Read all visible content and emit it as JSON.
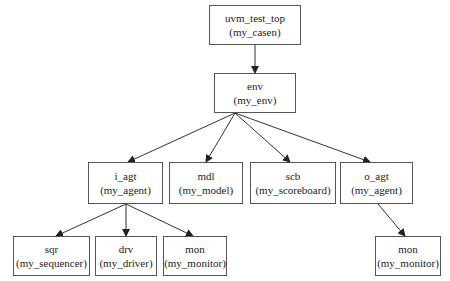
{
  "nodes": {
    "top": {
      "name": "uvm_test_top",
      "type": "(my_casen)"
    },
    "env": {
      "name": "env",
      "type": "(my_env)"
    },
    "i_agt": {
      "name": "i_agt",
      "type": "(my_agent)"
    },
    "mdl": {
      "name": "mdl",
      "type": "(my_model)"
    },
    "scb": {
      "name": "scb",
      "type": "(my_scoreboard)"
    },
    "o_agt": {
      "name": "o_agt",
      "type": "(my_agent)"
    },
    "sqr": {
      "name": "sqr",
      "type": "(my_sequencer)"
    },
    "drv": {
      "name": "drv",
      "type": "(my_driver)"
    },
    "mon_i": {
      "name": "mon",
      "type": "(my_monitor)"
    },
    "mon_o": {
      "name": "mon",
      "type": "(my_monitor)"
    }
  },
  "edges": [
    [
      "top",
      "env"
    ],
    [
      "env",
      "i_agt"
    ],
    [
      "env",
      "mdl"
    ],
    [
      "env",
      "scb"
    ],
    [
      "env",
      "o_agt"
    ],
    [
      "i_agt",
      "sqr"
    ],
    [
      "i_agt",
      "drv"
    ],
    [
      "i_agt",
      "mon_i"
    ],
    [
      "o_agt",
      "mon_o"
    ]
  ]
}
